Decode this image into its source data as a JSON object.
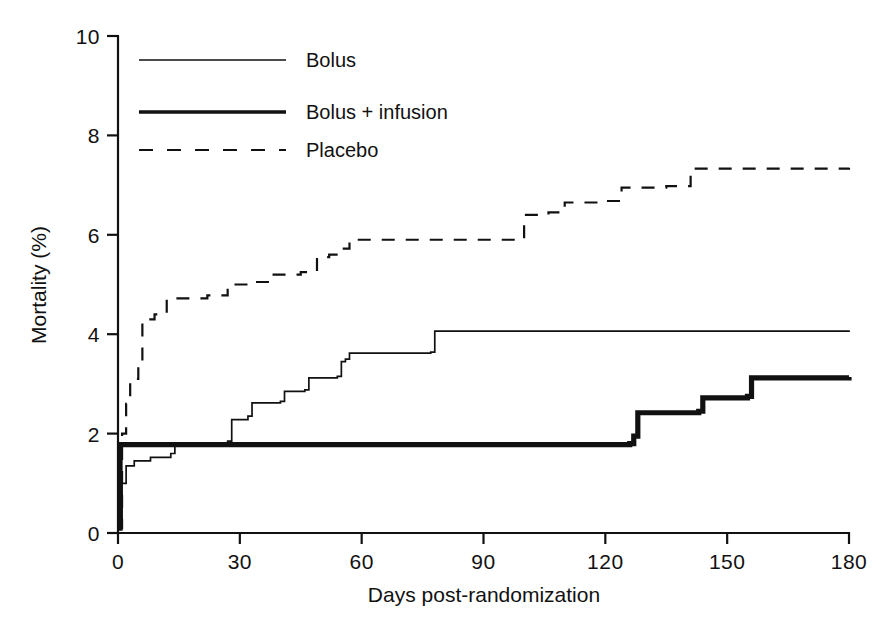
{
  "chart_data": {
    "type": "line",
    "title": "",
    "subtitle": "",
    "xlabel": "Days post-randomization",
    "ylabel": "Mortality (%)",
    "xlim": [
      0,
      180
    ],
    "ylim": [
      0,
      10
    ],
    "xticks": [
      "0",
      "30",
      "60",
      "90",
      "120",
      "150",
      "180"
    ],
    "xtick_values": [
      0,
      30,
      60,
      90,
      120,
      150,
      180
    ],
    "yticks": [
      "0",
      "2",
      "4",
      "6",
      "8",
      "10"
    ],
    "ytick_values": [
      0,
      2,
      4,
      6,
      8,
      10
    ],
    "grid": false,
    "legend_position": "top-left",
    "curve_style": "step-post (Kaplan-Meier cumulative mortality)",
    "series": [
      {
        "name": "Bolus",
        "line_style": "solid-thin",
        "color": "#111111",
        "final_value": 4.08,
        "points": [
          [
            0,
            0.12
          ],
          [
            1,
            1.0
          ],
          [
            2,
            1.35
          ],
          [
            4,
            1.45
          ],
          [
            8,
            1.52
          ],
          [
            13,
            1.6
          ],
          [
            14,
            1.78
          ],
          [
            20,
            1.8
          ],
          [
            27,
            1.85
          ],
          [
            28,
            2.28
          ],
          [
            32,
            2.35
          ],
          [
            33,
            2.62
          ],
          [
            40,
            2.65
          ],
          [
            41,
            2.85
          ],
          [
            46,
            2.88
          ],
          [
            47,
            3.12
          ],
          [
            54,
            3.15
          ],
          [
            55,
            3.45
          ],
          [
            56,
            3.5
          ],
          [
            57,
            3.62
          ],
          [
            77,
            3.64
          ],
          [
            78,
            4.06
          ],
          [
            180,
            4.08
          ]
        ]
      },
      {
        "name": "Bolus + infusion",
        "line_style": "solid-thick",
        "color": "#111111",
        "final_value": 3.14,
        "points": [
          [
            0,
            0.1
          ],
          [
            0.5,
            1.78
          ],
          [
            126,
            1.8
          ],
          [
            127,
            1.95
          ],
          [
            128,
            2.42
          ],
          [
            143,
            2.45
          ],
          [
            144,
            2.72
          ],
          [
            155,
            2.75
          ],
          [
            156,
            3.12
          ],
          [
            180,
            3.14
          ]
        ]
      },
      {
        "name": "Placebo",
        "line_style": "dashed",
        "color": "#111111",
        "final_value": 7.35,
        "points": [
          [
            0,
            0.1
          ],
          [
            1,
            2.0
          ],
          [
            2,
            2.6
          ],
          [
            3,
            3.1
          ],
          [
            5,
            3.45
          ],
          [
            6,
            4.3
          ],
          [
            9,
            4.4
          ],
          [
            12,
            4.72
          ],
          [
            22,
            4.78
          ],
          [
            27,
            5.0
          ],
          [
            32,
            5.05
          ],
          [
            38,
            5.2
          ],
          [
            45,
            5.25
          ],
          [
            49,
            5.55
          ],
          [
            52,
            5.6
          ],
          [
            55,
            5.72
          ],
          [
            57,
            5.9
          ],
          [
            99,
            5.92
          ],
          [
            100,
            6.4
          ],
          [
            106,
            6.45
          ],
          [
            110,
            6.65
          ],
          [
            120,
            6.68
          ],
          [
            124,
            6.95
          ],
          [
            135,
            6.98
          ],
          [
            141,
            7.33
          ],
          [
            180,
            7.35
          ]
        ]
      }
    ]
  },
  "legend": {
    "items": [
      {
        "label": "Bolus",
        "style": "solid-thin"
      },
      {
        "label": "Bolus + infusion",
        "style": "solid-thick"
      },
      {
        "label": "Placebo",
        "style": "dashed"
      }
    ]
  },
  "colors": {
    "ink": "#111111",
    "background": "#ffffff"
  }
}
